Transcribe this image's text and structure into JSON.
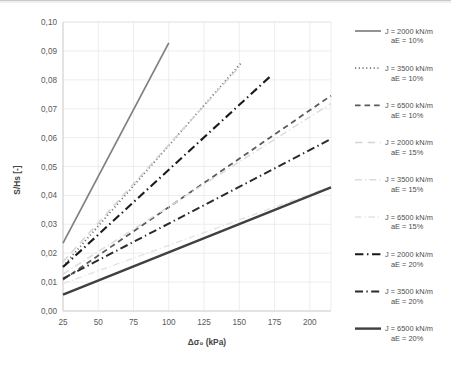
{
  "chart_data": {
    "type": "line",
    "title": "",
    "xlabel": "Δσ₀ (kPa)",
    "ylabel": "S/Hs [-]",
    "xlim": [
      25,
      215
    ],
    "ylim": [
      0.0,
      0.1
    ],
    "xticks": [
      25,
      50,
      75,
      100,
      125,
      150,
      175,
      200
    ],
    "xtick_labels": [
      "25",
      "50",
      "75",
      "100",
      "125",
      "150",
      "175",
      "200"
    ],
    "yticks": [
      0.0,
      0.01,
      0.02,
      0.03,
      0.04,
      0.05,
      0.06,
      0.07,
      0.08,
      0.09,
      0.1
    ],
    "ytick_labels": [
      "0,00",
      "0,01",
      "0,02",
      "0,03",
      "0,04",
      "0,05",
      "0,06",
      "0,07",
      "0,08",
      "0,09",
      "0,10"
    ],
    "grid": true,
    "legend_position": "right",
    "series": [
      {
        "name": "J = 2000 kN/m\naE = 10%",
        "label_line1": "J = 2000 kN/m",
        "label_line2": "aE = 10%",
        "style": "solid",
        "color": "#808080",
        "width": 1.7,
        "x": [
          25,
          100
        ],
        "y": [
          0.0235,
          0.0928
        ]
      },
      {
        "name": "J = 3500 kN/m\naE = 10%",
        "label_line1": "J = 3500 kN/m",
        "label_line2": "aE = 10%",
        "style": "dotted",
        "color": "#737373",
        "width": 1.8,
        "x": [
          25,
          152
        ],
        "y": [
          0.0155,
          0.0862
        ]
      },
      {
        "name": "J = 6500 kN/m\naE = 10%",
        "label_line1": "J = 6500 kN/m",
        "label_line2": "aE = 10%",
        "style": "dashed",
        "color": "#5a5a5a",
        "width": 1.8,
        "x": [
          25,
          215
        ],
        "y": [
          0.0108,
          0.0745
        ]
      },
      {
        "name": "J = 2000 kN/m\naE = 15%",
        "label_line1": "J = 2000 kN/m",
        "label_line2": "aE = 15%",
        "style": "longdash",
        "color": "#d4d4d4",
        "width": 1.5,
        "x": [
          25,
          150
        ],
        "y": [
          0.017,
          0.0845
        ]
      },
      {
        "name": "J = 3500 kN/m\naE = 15%",
        "label_line1": "J = 3500 kN/m",
        "label_line2": "aE = 15%",
        "style": "dashdot",
        "color": "#dcdcdc",
        "width": 1.5,
        "x": [
          25,
          215
        ],
        "y": [
          0.0128,
          0.0718
        ]
      },
      {
        "name": "J = 6500 kN/m\naE = 15%",
        "label_line1": "J = 6500 kN/m",
        "label_line2": "aE = 15%",
        "style": "dashdot",
        "color": "#e3e3e3",
        "width": 1.4,
        "x": [
          25,
          215
        ],
        "y": [
          0.0095,
          0.043
        ]
      },
      {
        "name": "J = 2000 kN/m\naE = 20%",
        "label_line1": "J = 2000 kN/m",
        "label_line2": "aE = 20%",
        "style": "dashdot-heavy",
        "color": "#1a1a1a",
        "width": 2.1,
        "x": [
          25,
          172
        ],
        "y": [
          0.0152,
          0.0812
        ]
      },
      {
        "name": "J = 3500 kN/m\naE = 20%",
        "label_line1": "J = 3500 kN/m",
        "label_line2": "aE = 20%",
        "style": "dashdot-heavy",
        "color": "#2b2b2b",
        "width": 2.0,
        "x": [
          25,
          215
        ],
        "y": [
          0.0112,
          0.0595
        ]
      },
      {
        "name": "J = 6500 kN/m\naE = 20%",
        "label_line1": "J = 6500 kN/m",
        "label_line2": "aE = 20%",
        "style": "solid-heavy",
        "color": "#404040",
        "width": 2.4,
        "x": [
          25,
          215
        ],
        "y": [
          0.0057,
          0.0428
        ]
      }
    ]
  },
  "axes": {
    "y_title": "S/Hs [-]",
    "x_title": "Δσ₀ (kPa)"
  }
}
